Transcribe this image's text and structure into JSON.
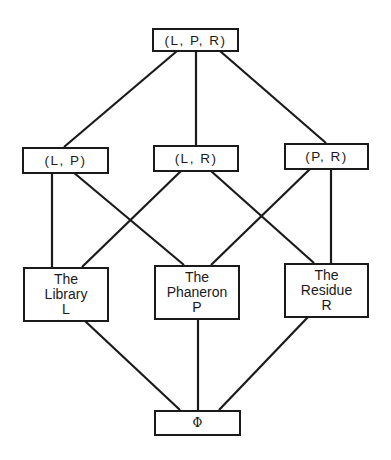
{
  "diagram": {
    "type": "lattice",
    "stroke_color": "#1a1a1a",
    "background_color": "#ffffff",
    "nodes": {
      "top": {
        "id": "LPR",
        "lines": [
          "(L, P, R)"
        ]
      },
      "lp": {
        "id": "LP",
        "lines": [
          "(L, P)"
        ]
      },
      "lr": {
        "id": "LR",
        "lines": [
          "(L, R)"
        ]
      },
      "pr": {
        "id": "PR",
        "lines": [
          "(P, R)"
        ]
      },
      "library": {
        "id": "L",
        "lines": [
          "The",
          "Library",
          "L"
        ]
      },
      "phaneron": {
        "id": "P",
        "lines": [
          "The",
          "Phaneron",
          "P"
        ]
      },
      "residue": {
        "id": "R",
        "lines": [
          "The",
          "Residue",
          "R"
        ]
      },
      "bottom": {
        "id": "PHI",
        "lines": [
          "Φ"
        ]
      }
    },
    "edges": [
      {
        "from": "LPR",
        "to": "LP"
      },
      {
        "from": "LPR",
        "to": "LR"
      },
      {
        "from": "LPR",
        "to": "PR"
      },
      {
        "from": "LP",
        "to": "L"
      },
      {
        "from": "LP",
        "to": "P"
      },
      {
        "from": "LR",
        "to": "L"
      },
      {
        "from": "LR",
        "to": "R"
      },
      {
        "from": "PR",
        "to": "P"
      },
      {
        "from": "PR",
        "to": "R"
      },
      {
        "from": "L",
        "to": "PHI"
      },
      {
        "from": "P",
        "to": "PHI"
      },
      {
        "from": "R",
        "to": "PHI"
      }
    ]
  }
}
